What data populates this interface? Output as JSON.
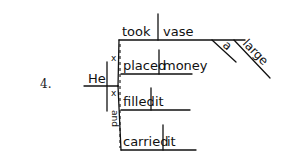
{
  "exercise": {
    "number": "4."
  },
  "diagram": {
    "subject": "He",
    "conjunction": "and",
    "understood_marker": "x",
    "predicates": [
      {
        "verb": "took",
        "object": "vase",
        "modifiers": [
          "a",
          "large"
        ]
      },
      {
        "verb": "placed",
        "object": "money",
        "modifiers": []
      },
      {
        "verb": "filled",
        "object": "it",
        "modifiers": []
      },
      {
        "verb": "carried",
        "object": "it",
        "modifiers": []
      }
    ]
  }
}
